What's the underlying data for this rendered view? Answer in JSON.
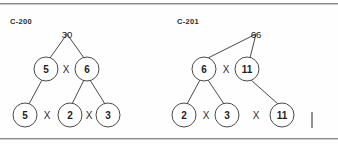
{
  "page": {
    "background_color": "#fefefe",
    "ink_color": "#4a4a4a",
    "rule_color": "#8a8a8a"
  },
  "figures": [
    {
      "label": "C-200",
      "root_value": "30",
      "nodes": [
        {
          "id": "n5a",
          "value": "5",
          "cx": 46,
          "cy": 69,
          "r": 12
        },
        {
          "id": "n6",
          "value": "6",
          "cx": 87,
          "cy": 69,
          "r": 12
        },
        {
          "id": "n5b",
          "value": "5",
          "cx": 25,
          "cy": 115,
          "r": 12
        },
        {
          "id": "n2",
          "value": "2",
          "cx": 70,
          "cy": 115,
          "r": 12
        },
        {
          "id": "n3",
          "value": "3",
          "cx": 108,
          "cy": 115,
          "r": 12
        }
      ],
      "root": {
        "x": 67,
        "y": 34
      },
      "operators": [
        {
          "symbol": "X",
          "x": 66,
          "y": 69
        },
        {
          "symbol": "X",
          "x": 47,
          "y": 115
        },
        {
          "symbol": "X",
          "x": 89,
          "y": 115
        }
      ],
      "edges": [
        {
          "x1": 67,
          "y1": 34,
          "x2": 50,
          "y2": 58
        },
        {
          "x1": 67,
          "y1": 34,
          "x2": 84,
          "y2": 58
        },
        {
          "x1": 42,
          "y1": 80,
          "x2": 29,
          "y2": 104
        },
        {
          "x1": 84,
          "y1": 80,
          "x2": 72,
          "y2": 104
        },
        {
          "x1": 90,
          "y1": 80,
          "x2": 105,
          "y2": 104
        }
      ]
    },
    {
      "label": "C-201",
      "root_value": "66",
      "nodes": [
        {
          "id": "m6",
          "value": "6",
          "cx": 35,
          "cy": 69,
          "r": 12
        },
        {
          "id": "m11a",
          "value": "11",
          "cx": 78,
          "cy": 69,
          "r": 12
        },
        {
          "id": "m2",
          "value": "2",
          "cx": 15,
          "cy": 115,
          "r": 12
        },
        {
          "id": "m3",
          "value": "3",
          "cx": 58,
          "cy": 115,
          "r": 12
        },
        {
          "id": "m11b",
          "value": "11",
          "cx": 113,
          "cy": 115,
          "r": 12
        }
      ],
      "root": {
        "x": 87,
        "y": 34
      },
      "operators": [
        {
          "symbol": "X",
          "x": 57,
          "y": 69
        },
        {
          "symbol": "X",
          "x": 37,
          "y": 115
        },
        {
          "symbol": "X",
          "x": 87,
          "y": 115
        }
      ],
      "edges": [
        {
          "x1": 87,
          "y1": 34,
          "x2": 39,
          "y2": 58
        },
        {
          "x1": 87,
          "y1": 34,
          "x2": 81,
          "y2": 58
        },
        {
          "x1": 31,
          "y1": 80,
          "x2": 18,
          "y2": 104
        },
        {
          "x1": 39,
          "y1": 80,
          "x2": 55,
          "y2": 104
        },
        {
          "x1": 82,
          "y1": 80,
          "x2": 109,
          "y2": 104
        }
      ]
    }
  ]
}
